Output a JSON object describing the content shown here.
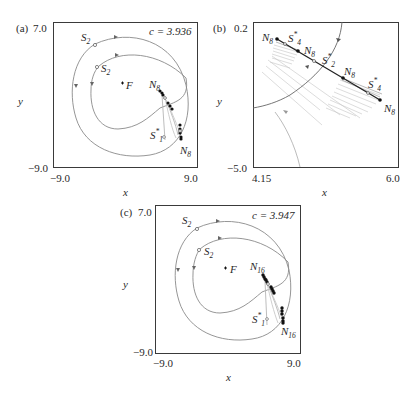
{
  "figure": {
    "panels": [
      {
        "id": "a",
        "tag": "(a)",
        "param_label": "c = 3.936",
        "x_axis": {
          "label": "x",
          "min": "−9.0",
          "max": "9.0"
        },
        "y_axis": {
          "label": "y",
          "min": "−9.0",
          "max": "7.0"
        },
        "point_labels": {
          "s2_outer": "S",
          "s2_outer_sub": "2",
          "s2_inner": "S",
          "s2_inner_sub": "2",
          "focus": "F",
          "n_upper": "N",
          "n_upper_sub": "8",
          "n_lower": "N",
          "n_lower_sub": "8",
          "s1": "S",
          "s1_sub": "1",
          "s1_sup": "*"
        }
      },
      {
        "id": "b",
        "tag": "(b)",
        "x_axis": {
          "label": "x",
          "min": "4.15",
          "max": "6.0"
        },
        "y_axis": {
          "label": "y",
          "min": "−5.0",
          "max": "0.2"
        },
        "point_labels": {
          "n1": "N",
          "n1_sub": "8",
          "s4a": "S",
          "s4a_sub": "4",
          "s4a_sup": "*",
          "n2": "N",
          "n2_sub": "8",
          "s2": "S",
          "s2_sub": "2",
          "s2_sup": "*",
          "n3": "N",
          "n3_sub": "8",
          "s4b": "S",
          "s4b_sub": "4",
          "s4b_sup": "*",
          "n4": "N",
          "n4_sub": "8"
        }
      },
      {
        "id": "c",
        "tag": "(c)",
        "param_label": "c = 3.947",
        "x_axis": {
          "label": "x",
          "min": "−9.0",
          "max": "9.0"
        },
        "y_axis": {
          "label": "y",
          "min": "−9.0",
          "max": "7.0"
        },
        "point_labels": {
          "s2_outer": "S",
          "s2_outer_sub": "2",
          "s2_inner": "S",
          "s2_inner_sub": "2",
          "focus": "F",
          "n_upper": "N",
          "n_upper_sub": "16",
          "n_lower": "N",
          "n_lower_sub": "16",
          "s1": "S",
          "s1_sub": "1",
          "s1_sup": "*"
        }
      }
    ],
    "colors": {
      "frame": "#3a3a3a",
      "curve": "#8a8a8a",
      "points": "#111111",
      "manifold": "#333333"
    }
  }
}
